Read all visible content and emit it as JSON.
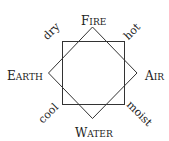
{
  "elements": {
    "top": {
      "first": "F",
      "rest": "IRE"
    },
    "left": {
      "first": "E",
      "rest": "ARTH"
    },
    "right": {
      "first": "A",
      "rest": "IR"
    },
    "bottom": {
      "first": "W",
      "rest": "ATER"
    }
  },
  "qualities": {
    "top_left": "dry",
    "top_right": "hot",
    "bottom_left": "cool",
    "bottom_right": "moist"
  },
  "colors": {
    "line": "#333333",
    "text": "#222222"
  }
}
